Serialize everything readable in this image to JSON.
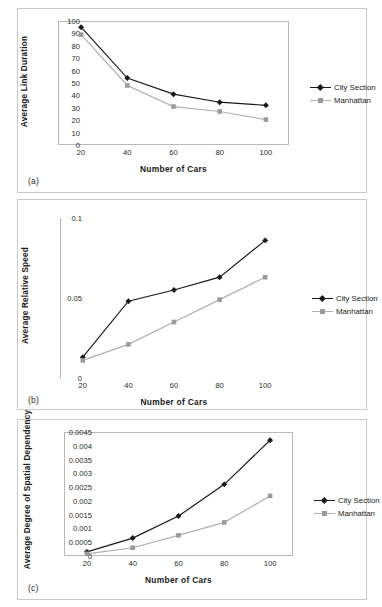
{
  "figure": {
    "panels": [
      {
        "tag": "(a)"
      },
      {
        "tag": "(b)"
      },
      {
        "tag": "(c)"
      }
    ],
    "series_colors": {
      "city_section": "#1a1a1a",
      "manhattan": "#b0b0b0"
    },
    "legend_labels": {
      "city_section": "City Section",
      "manhattan": "Manhattan"
    }
  },
  "chart_data": [
    {
      "type": "line",
      "panel": "(a)",
      "title": "",
      "xlabel": "Number of Cars",
      "ylabel": "Average Link Duration",
      "x": [
        20,
        40,
        60,
        80,
        100
      ],
      "xticklabels": [
        "20",
        "40",
        "60",
        "80",
        "100"
      ],
      "yticklabels": [
        "0",
        "10",
        "20",
        "30",
        "40",
        "50",
        "60",
        "70",
        "80",
        "90",
        "100"
      ],
      "xlim": [
        10,
        110
      ],
      "ylim": [
        0,
        100
      ],
      "grid": false,
      "legend_position": "right",
      "series": [
        {
          "name": "City Section",
          "values": [
            95,
            54,
            41,
            34.5,
            32
          ],
          "color": "#1a1a1a",
          "marker": "diamond"
        },
        {
          "name": "Manhattan",
          "values": [
            89,
            48,
            31,
            27,
            20.5
          ],
          "color": "#b0b0b0",
          "marker": "square"
        }
      ]
    },
    {
      "type": "line",
      "panel": "(b)",
      "title": "",
      "xlabel": "Number of Cars",
      "ylabel": "Average Relative Speed",
      "x": [
        20,
        40,
        60,
        80,
        100
      ],
      "xticklabels": [
        "20",
        "40",
        "60",
        "80",
        "100"
      ],
      "yticklabels": [
        "0",
        "0.05",
        "0.1"
      ],
      "xlim": [
        10,
        110
      ],
      "ylim": [
        0,
        0.1
      ],
      "grid": false,
      "legend_position": "right",
      "series": [
        {
          "name": "City Section",
          "values": [
            0.013,
            0.048,
            0.055,
            0.063,
            0.086
          ],
          "color": "#1a1a1a",
          "marker": "diamond"
        },
        {
          "name": "Manhattan",
          "values": [
            0.011,
            0.021,
            0.035,
            0.049,
            0.063
          ],
          "color": "#b0b0b0",
          "marker": "square"
        }
      ]
    },
    {
      "type": "line",
      "panel": "(c)",
      "title": "",
      "xlabel": "Number of Cars",
      "ylabel": "Average Degree of Spatial Dependency",
      "x": [
        20,
        40,
        60,
        80,
        100
      ],
      "xticklabels": [
        "20",
        "40",
        "60",
        "80",
        "100"
      ],
      "yticklabels": [
        "0",
        "0.0005",
        "0.001",
        "0.0015",
        "0.002",
        "0.0025",
        "0.003",
        "0.0035",
        "0.004",
        "0.0045"
      ],
      "xlim": [
        10,
        110
      ],
      "ylim": [
        0,
        0.0045
      ],
      "grid": false,
      "legend_position": "right",
      "series": [
        {
          "name": "City Section",
          "values": [
            0.00015,
            0.00065,
            0.00145,
            0.0026,
            0.0042
          ],
          "color": "#1a1a1a",
          "marker": "diamond"
        },
        {
          "name": "Manhattan",
          "values": [
            8e-05,
            0.0003,
            0.00075,
            0.00122,
            0.00218
          ],
          "color": "#b0b0b0",
          "marker": "square"
        }
      ]
    }
  ]
}
